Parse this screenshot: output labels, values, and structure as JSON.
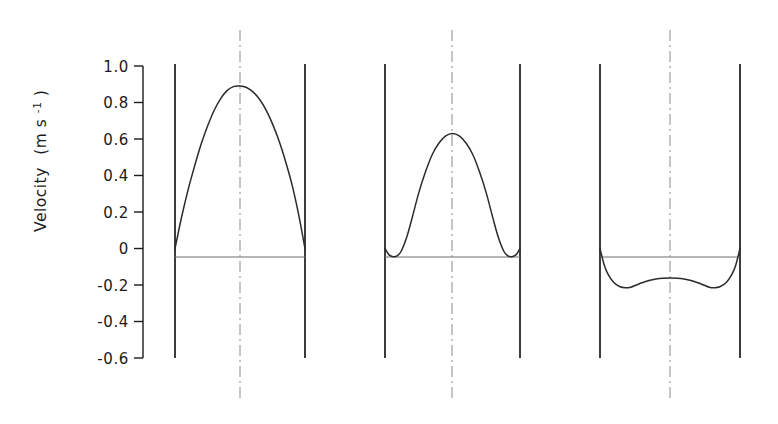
{
  "figure": {
    "background": "#ffffff",
    "ink_color": "#1a1a1a",
    "line_color": "#2b2b2b",
    "centerline_color": "#8a8a8a",
    "zeroline_color": "#6e6e6e"
  },
  "axis": {
    "title_main": "Velocity",
    "title_units_open": "(m s",
    "title_units_exp": "-1",
    "title_units_close": ")",
    "title_full": "Velocity (m s-1)",
    "tick_labels": [
      "1.0",
      "0.8",
      "0.6",
      "0.4",
      "0.2",
      "0",
      "-0.2",
      "-0.4",
      "-0.6"
    ],
    "tick_values": [
      1.0,
      0.8,
      0.6,
      0.4,
      0.2,
      0,
      -0.2,
      -0.4,
      -0.6
    ],
    "ylim": [
      -0.6,
      1.0
    ]
  },
  "chart_data": {
    "type": "line",
    "title": "",
    "xlabel": "",
    "ylabel": "Velocity (m s-1)",
    "ylim": [
      -0.6,
      1.0
    ],
    "yticks": [
      1.0,
      0.8,
      0.6,
      0.4,
      0.2,
      0,
      -0.2,
      -0.4,
      -0.6
    ],
    "ytick_labels": [
      "1.0",
      "0.8",
      "0.6",
      "0.4",
      "0.2",
      "0",
      "-0.2",
      "-0.4",
      "-0.6"
    ],
    "grid": false,
    "legend": "none",
    "annotations": [
      "Three channel cross-section velocity profiles between vertical walls",
      "Dash-dot line marks the channel centreline in each panel",
      "Horizontal thin line marks the zero-velocity datum in each panel"
    ],
    "panels": [
      {
        "name": "panel-1",
        "description": "Parabolic forward flow, zero at both walls, single central maximum",
        "peak_value": 0.89,
        "wall_values": [
          0.0,
          0.0
        ],
        "min_value": 0.0,
        "x_normalized": [
          0.0,
          0.05,
          0.1,
          0.15,
          0.2,
          0.25,
          0.3,
          0.35,
          0.4,
          0.45,
          0.5,
          0.55,
          0.6,
          0.65,
          0.7,
          0.75,
          0.8,
          0.85,
          0.9,
          0.95,
          1.0
        ],
        "values": [
          0.0,
          0.17,
          0.32,
          0.45,
          0.57,
          0.67,
          0.755,
          0.82,
          0.865,
          0.887,
          0.89,
          0.882,
          0.858,
          0.818,
          0.76,
          0.683,
          0.59,
          0.478,
          0.35,
          0.19,
          0.0
        ]
      },
      {
        "name": "panel-2",
        "description": "Forward core flow with small reversed flow near both walls",
        "peak_value": 0.63,
        "wall_values": [
          0.0,
          0.0
        ],
        "min_value": -0.045,
        "x_normalized": [
          0.0,
          0.03,
          0.06,
          0.09,
          0.12,
          0.16,
          0.2,
          0.25,
          0.3,
          0.35,
          0.4,
          0.45,
          0.5,
          0.55,
          0.6,
          0.65,
          0.7,
          0.75,
          0.8,
          0.84,
          0.88,
          0.91,
          0.94,
          0.97,
          1.0
        ],
        "values": [
          0.0,
          -0.035,
          -0.045,
          -0.04,
          -0.015,
          0.06,
          0.165,
          0.305,
          0.42,
          0.515,
          0.578,
          0.617,
          0.63,
          0.617,
          0.578,
          0.515,
          0.42,
          0.305,
          0.165,
          0.06,
          -0.015,
          -0.04,
          -0.045,
          -0.035,
          0.0
        ]
      },
      {
        "name": "panel-3",
        "description": "Fully reversed flow, W-shaped profile with two minima and a slight central rise",
        "peak_value": 0.0,
        "wall_values": [
          0.0,
          0.0
        ],
        "min_value": -0.215,
        "centre_value": -0.163,
        "x_normalized": [
          0.0,
          0.03,
          0.06,
          0.1,
          0.14,
          0.18,
          0.22,
          0.26,
          0.3,
          0.35,
          0.4,
          0.45,
          0.5,
          0.55,
          0.6,
          0.65,
          0.7,
          0.74,
          0.78,
          0.82,
          0.86,
          0.9,
          0.94,
          0.97,
          1.0
        ],
        "values": [
          0.0,
          -0.09,
          -0.145,
          -0.188,
          -0.208,
          -0.215,
          -0.212,
          -0.2,
          -0.188,
          -0.175,
          -0.167,
          -0.163,
          -0.162,
          -0.163,
          -0.167,
          -0.175,
          -0.188,
          -0.2,
          -0.212,
          -0.215,
          -0.208,
          -0.188,
          -0.145,
          -0.09,
          0.0
        ]
      }
    ]
  },
  "geometry": {
    "axis_x": 143,
    "y_top": 66,
    "y_bottom": 358,
    "tick_length": 9,
    "wall_top": 64,
    "wall_bottom": 358,
    "centerline_top": 30,
    "centerline_bottom": 402,
    "zero_y": 257,
    "panels": [
      {
        "left_wall": 175,
        "right_wall": 305,
        "centre": 240
      },
      {
        "left_wall": 385,
        "right_wall": 520,
        "centre": 452
      },
      {
        "left_wall": 600,
        "right_wall": 740,
        "centre": 670
      }
    ]
  }
}
